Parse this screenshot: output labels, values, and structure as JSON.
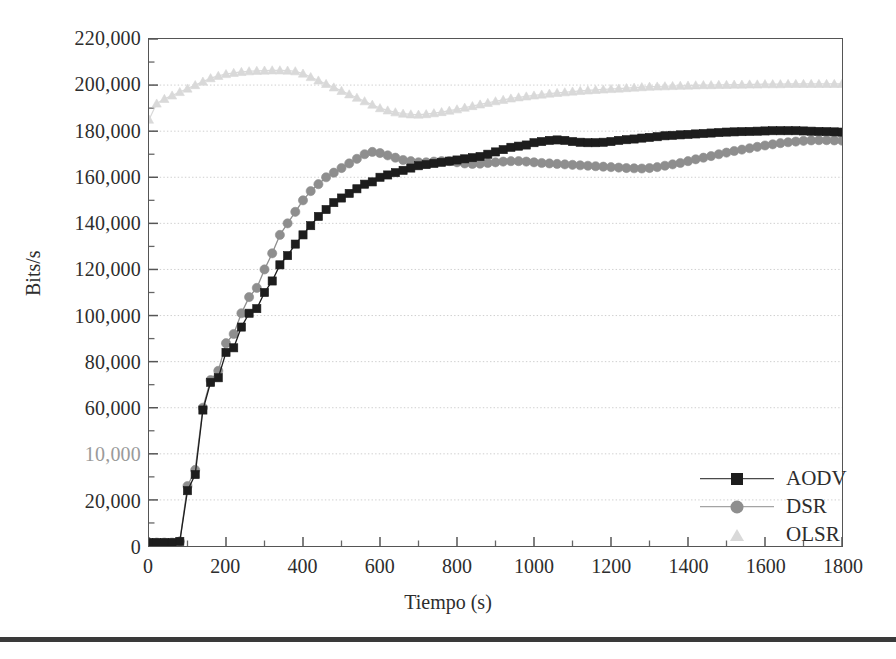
{
  "figure": {
    "background": "#ffffff",
    "bottom_rule_color": "#3a3a3a"
  },
  "axis": {
    "ylabel": "Bits/s",
    "xlabel": "Tiempo (s)",
    "ytick_labels": [
      "0",
      "20,000",
      "10,000",
      "60,000",
      "80,000",
      "100,000",
      "120,000",
      "140,000",
      "160,000",
      "180,000",
      "200,000",
      "220,000"
    ],
    "xtick_labels": [
      "0",
      "200",
      "400",
      "600",
      "800",
      "1000",
      "1200",
      "1400",
      "1600",
      "1800"
    ]
  },
  "legend": {
    "items": [
      {
        "label": "AODV",
        "marker": "square-marker",
        "color": "#1d1d1d"
      },
      {
        "label": "DSR",
        "marker": "circle-marker",
        "color": "#8e8e8e"
      },
      {
        "label": "OLSR",
        "marker": "triangle-marker",
        "color": "#d9d9d9"
      }
    ]
  },
  "chart_data": {
    "type": "line",
    "title": "",
    "xlabel": "Tiempo (s)",
    "ylabel": "Bits/s",
    "xlim": [
      0,
      1800
    ],
    "ylim": [
      0,
      220000
    ],
    "xticks": [
      0,
      200,
      400,
      600,
      800,
      1000,
      1200,
      1400,
      1600,
      1800
    ],
    "yticks": [
      0,
      20000,
      40000,
      60000,
      80000,
      100000,
      120000,
      140000,
      160000,
      180000,
      200000,
      220000
    ],
    "ytick_display": [
      "0",
      "20,000",
      "10,000",
      "60,000",
      "80,000",
      "100,000",
      "120,000",
      "140,000",
      "160,000",
      "180,000",
      "200,000",
      "220,000"
    ],
    "ytick_note": "The 40,000 label is faded in the scan and reads as '10,000'",
    "grid": "horizontal-dotted",
    "legend_position": "lower-right",
    "x": [
      0,
      20,
      40,
      60,
      80,
      100,
      120,
      140,
      160,
      180,
      200,
      220,
      240,
      260,
      280,
      300,
      320,
      340,
      360,
      380,
      400,
      420,
      440,
      460,
      480,
      500,
      520,
      540,
      560,
      580,
      600,
      620,
      640,
      660,
      680,
      700,
      720,
      740,
      760,
      780,
      800,
      820,
      840,
      860,
      880,
      900,
      920,
      940,
      960,
      980,
      1000,
      1020,
      1040,
      1060,
      1080,
      1100,
      1120,
      1140,
      1160,
      1180,
      1200,
      1220,
      1240,
      1260,
      1280,
      1300,
      1320,
      1340,
      1360,
      1380,
      1400,
      1420,
      1440,
      1460,
      1480,
      1500,
      1520,
      1540,
      1560,
      1580,
      1600,
      1620,
      1640,
      1660,
      1680,
      1700,
      1720,
      1740,
      1760,
      1780,
      1800
    ],
    "series": [
      {
        "name": "AODV",
        "marker": "square",
        "color": "#1d1d1d",
        "values": [
          1500,
          1500,
          1500,
          1500,
          2000,
          24000,
          31000,
          59000,
          71000,
          73000,
          84000,
          86000,
          95000,
          101000,
          103000,
          110000,
          115000,
          122000,
          126000,
          131000,
          135000,
          139000,
          143000,
          146000,
          149000,
          151000,
          153000,
          155000,
          157000,
          158000,
          160000,
          161000,
          162000,
          163000,
          164000,
          165000,
          165500,
          166000,
          166500,
          167000,
          167500,
          168000,
          168500,
          169000,
          170000,
          171000,
          172000,
          173000,
          173500,
          174000,
          175000,
          175500,
          176000,
          176200,
          176000,
          175500,
          175200,
          175000,
          175000,
          175200,
          175500,
          176000,
          176300,
          176600,
          177000,
          177300,
          177600,
          178000,
          178200,
          178400,
          178600,
          178800,
          179000,
          179200,
          179400,
          179600,
          179700,
          179800,
          179900,
          180000,
          180100,
          180200,
          180200,
          180200,
          180200,
          180100,
          180000,
          179900,
          179800,
          179700,
          179600
        ]
      },
      {
        "name": "DSR",
        "marker": "circle",
        "color": "#8e8e8e",
        "values": [
          1500,
          1500,
          1500,
          1500,
          2000,
          26000,
          33000,
          60000,
          72000,
          76000,
          88000,
          92000,
          101000,
          108000,
          112000,
          120000,
          127000,
          135000,
          140000,
          145000,
          150000,
          154000,
          157000,
          160000,
          162000,
          164000,
          166000,
          168000,
          170000,
          171000,
          170500,
          169500,
          168500,
          167500,
          167000,
          166500,
          166500,
          166800,
          167000,
          167000,
          166500,
          166000,
          165800,
          165900,
          166200,
          166500,
          166800,
          167000,
          167000,
          166800,
          166500,
          166200,
          166000,
          165800,
          165600,
          165400,
          165200,
          165000,
          164800,
          164600,
          164400,
          164200,
          164000,
          163900,
          163800,
          164000,
          164400,
          165000,
          165600,
          166200,
          167000,
          167800,
          168500,
          169200,
          170000,
          170700,
          171400,
          172000,
          172600,
          173200,
          173800,
          174300,
          174800,
          175200,
          175500,
          175800,
          176000,
          176100,
          176100,
          176000,
          175900
        ]
      },
      {
        "name": "OLSR",
        "marker": "triangle",
        "color": "#d9d9d9",
        "values": [
          185000,
          192000,
          194000,
          195500,
          197000,
          198500,
          200000,
          201500,
          203000,
          204000,
          204800,
          205300,
          205700,
          206000,
          206200,
          206300,
          206400,
          206400,
          206300,
          206000,
          205000,
          203500,
          202000,
          200500,
          199000,
          197500,
          196000,
          194500,
          193000,
          191500,
          190000,
          189000,
          188200,
          187600,
          187300,
          187200,
          187400,
          187800,
          188300,
          188900,
          189500,
          190200,
          190900,
          191600,
          192300,
          193000,
          193600,
          194200,
          194700,
          195100,
          195500,
          195900,
          196300,
          196600,
          196900,
          197200,
          197500,
          197700,
          197900,
          198100,
          198300,
          198500,
          198700,
          198900,
          199100,
          199300,
          199400,
          199500,
          199600,
          199700,
          199800,
          199900,
          200000,
          200000,
          200100,
          200100,
          200200,
          200200,
          200300,
          200300,
          200400,
          200400,
          200400,
          200500,
          200500,
          200500,
          200500,
          200500,
          200500,
          200500,
          200500
        ]
      }
    ]
  }
}
